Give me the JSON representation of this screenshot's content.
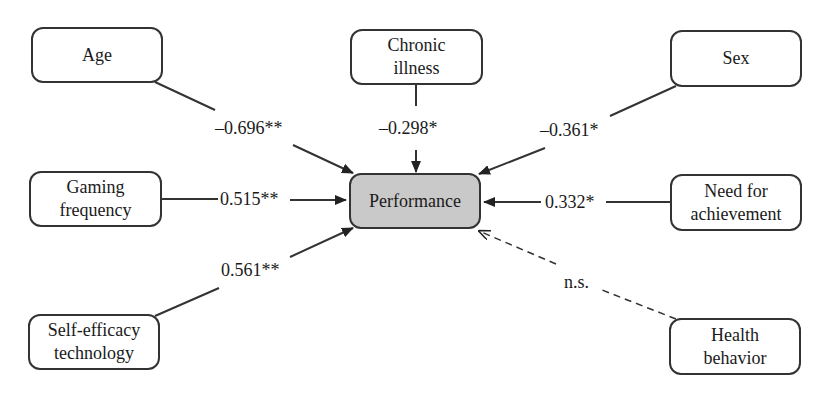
{
  "diagram": {
    "target": {
      "label": "Performance"
    },
    "predictors": [
      {
        "id": "age",
        "lines": [
          "Age"
        ],
        "coef": "–0.696**",
        "significant": true
      },
      {
        "id": "chronic-illness",
        "lines": [
          "Chronic",
          "illness"
        ],
        "coef": "–0.298*",
        "significant": true
      },
      {
        "id": "sex",
        "lines": [
          "Sex"
        ],
        "coef": "–0.361*",
        "significant": true
      },
      {
        "id": "gaming-frequency",
        "lines": [
          "Gaming",
          "frequency"
        ],
        "coef": "0.515**",
        "significant": true
      },
      {
        "id": "need-for-achievement",
        "lines": [
          "Need for",
          "achievement"
        ],
        "coef": "0.332*",
        "significant": true
      },
      {
        "id": "self-efficacy-technology",
        "lines": [
          "Self-efficacy",
          "technology"
        ],
        "coef": "0.561**",
        "significant": true
      },
      {
        "id": "health-behavior",
        "lines": [
          "Health",
          "behavior"
        ],
        "coef": "n.s.",
        "significant": false
      }
    ]
  },
  "colors": {
    "line": "#333333",
    "target_fill": "#c9c9c9",
    "node_fill": "#ffffff"
  }
}
